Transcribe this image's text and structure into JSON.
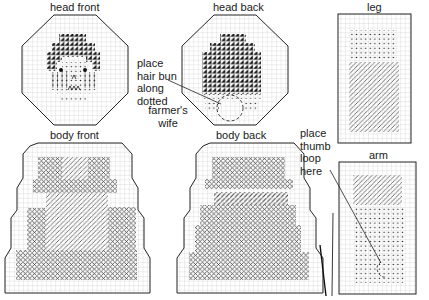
{
  "title": "farmer's wife",
  "title_lines": [
    "farmer's",
    "wife"
  ],
  "pieces": {
    "head_front": {
      "label": "head front"
    },
    "head_back": {
      "label": "head back"
    },
    "leg": {
      "label": "leg"
    },
    "arm": {
      "label": "arm"
    },
    "body_front": {
      "label": "body front"
    },
    "body_back": {
      "label": "body back"
    }
  },
  "annotations": {
    "hair_bun": {
      "lines": [
        "place",
        "hair bun",
        "along",
        "dotted"
      ]
    },
    "thumb_loop": {
      "lines": [
        "place",
        "thumb",
        "loop",
        "here"
      ]
    }
  },
  "legend_symbols": {
    "hair_half_cross": "black-triangle-stitch",
    "cross_stitch": "x-stitch",
    "slant_stitch": "diagonal-slant-stitch",
    "dot_stitch": "dot",
    "vertical_stitch": "vertical-line"
  },
  "colors": {
    "grid": "#c8c8c8",
    "outline": "#222222",
    "ink": "#111111",
    "background": "#ffffff"
  }
}
